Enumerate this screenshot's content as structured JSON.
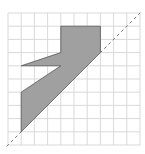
{
  "figure": {
    "grid": {
      "columns": 10,
      "rows": 10,
      "origin_px": [
        8,
        13
      ],
      "cell_px": 13.2,
      "line_color": "#d9d9d9"
    },
    "shape": {
      "vertices_grid": [
        [
          4,
          1
        ],
        [
          7,
          1
        ],
        [
          7,
          3
        ],
        [
          1,
          9
        ],
        [
          1,
          6
        ],
        [
          4,
          4
        ],
        [
          1,
          4
        ],
        [
          4,
          3
        ]
      ],
      "fill_color": "#a0a0a0",
      "stroke_color": "#555555"
    },
    "dashed_line": {
      "from_grid": [
        -0.1,
        10.1
      ],
      "to_grid": [
        10.1,
        -0.1
      ],
      "color": "#777777",
      "dash": "3,3"
    }
  }
}
